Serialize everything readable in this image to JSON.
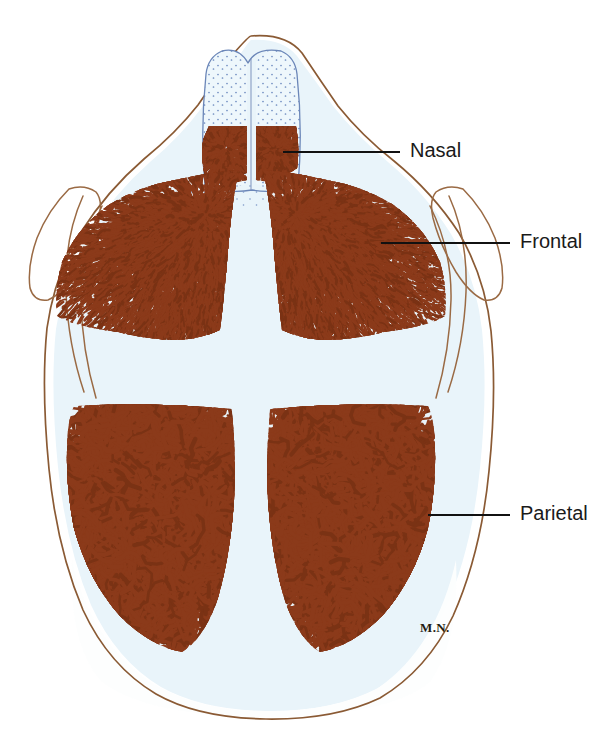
{
  "figure": {
    "signature": "M.N.",
    "background_color": "#ffffff",
    "bone_color": "#8b3a1a",
    "bone_color_dark": "#7a3214",
    "outline_color": "#8a5a34",
    "cartilage_fill": "#e8f3f9",
    "stipple_color": "#6b86b8",
    "label_color": "#1a1a1a"
  },
  "labels": [
    {
      "id": "nasal",
      "text": "Nasal",
      "text_x": 410,
      "text_y": 152,
      "leader_x1": 283,
      "leader_y1": 152,
      "leader_x2": 400,
      "leader_y2": 152
    },
    {
      "id": "frontal",
      "text": "Frontal",
      "text_x": 520,
      "text_y": 243,
      "leader_x1": 381,
      "leader_y1": 243,
      "leader_x2": 510,
      "leader_y2": 243
    },
    {
      "id": "parietal",
      "text": "Parietal",
      "text_x": 520,
      "text_y": 515,
      "leader_x1": 428,
      "leader_y1": 515,
      "leader_x2": 510,
      "leader_y2": 515
    }
  ],
  "regions": [
    {
      "id": "nasal-bone-left",
      "name": "Nasal bone (left)",
      "bone": "nasal",
      "side": "left",
      "texture": "dense-spicule"
    },
    {
      "id": "nasal-bone-right",
      "name": "Nasal bone (right)",
      "bone": "nasal",
      "side": "right",
      "texture": "dense-spicule"
    },
    {
      "id": "frontal-bone-left",
      "name": "Frontal bone (left)",
      "bone": "frontal",
      "side": "left",
      "texture": "radiating-spicule"
    },
    {
      "id": "frontal-bone-right",
      "name": "Frontal bone (right)",
      "bone": "frontal",
      "side": "right",
      "texture": "radiating-spicule"
    },
    {
      "id": "parietal-bone-left",
      "name": "Parietal bone (left)",
      "bone": "parietal",
      "side": "left",
      "texture": "reticular"
    },
    {
      "id": "parietal-bone-right",
      "name": "Parietal bone (right)",
      "bone": "parietal",
      "side": "right",
      "texture": "reticular"
    }
  ],
  "features": [
    {
      "id": "nasal-cartilage",
      "name": "Nasal cartilage",
      "fill": "#eef6fb",
      "stipple": true
    },
    {
      "id": "anterior-fontanelle",
      "name": "Anterior fontanelle",
      "fill": "#e8f3f9"
    },
    {
      "id": "metopic-suture",
      "name": "Metopic suture"
    },
    {
      "id": "sagittal-suture",
      "name": "Sagittal suture"
    },
    {
      "id": "coronal-suture",
      "name": "Coronal suture"
    }
  ]
}
